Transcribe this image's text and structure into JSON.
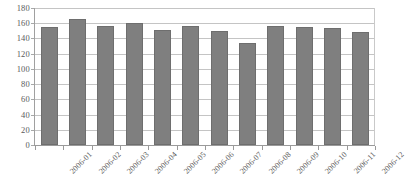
{
  "chart_data": {
    "type": "bar",
    "title": "",
    "subtitle": "",
    "xlabel": "",
    "ylabel": "",
    "categories": [
      "2006-01",
      "2006-02",
      "2006-03",
      "2006-04",
      "2006-05",
      "2006-06",
      "2006-07",
      "2006-08",
      "2006-09",
      "2006-10",
      "2006-11",
      "2006-12"
    ],
    "values": [
      155,
      165,
      156,
      160,
      151,
      157,
      150,
      134,
      156,
      155,
      154,
      148
    ],
    "ylim": [
      0,
      180
    ],
    "ytick_values": [
      0,
      20,
      40,
      60,
      80,
      100,
      120,
      140,
      160,
      180
    ],
    "ytick_labels": [
      "0",
      "20",
      "40",
      "60",
      "80",
      "100",
      "120",
      "140",
      "160",
      "180"
    ],
    "grid": true,
    "grid_axis": "y",
    "legend": false,
    "legend_position": "none",
    "series": [
      {
        "name": "",
        "color": "#7f7f7f",
        "values": [
          155,
          165,
          156,
          160,
          151,
          157,
          150,
          134,
          156,
          155,
          154,
          148
        ]
      }
    ],
    "colors": {
      "bar_fill": "#7f7f7f",
      "bar_border": "#6e6e6e",
      "gridline": "#c4c4c4",
      "axis_line": "#9a9a9a",
      "tick_label": "#5a5a5a",
      "background": "#ffffff"
    },
    "xtick_label_rotation": -45
  }
}
